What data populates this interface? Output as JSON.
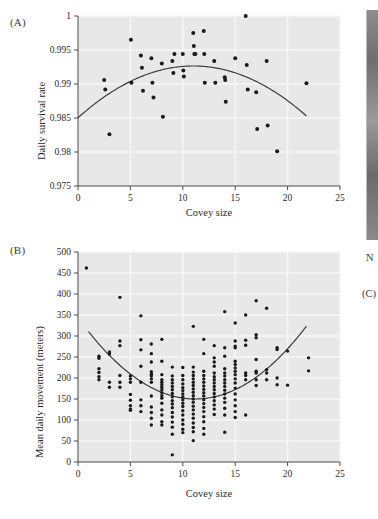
{
  "figure": {
    "panel_a_label": "(A)",
    "panel_b_label": "(B)",
    "edge_artifact_n": "N",
    "edge_artifact_c": "(C)",
    "page_background": "#ffffff",
    "plot_background": "#e8e8e8",
    "gridline_color": "#f7f7f7",
    "point_color": "#1a1a1a",
    "curve_color": "#3d3d3d",
    "axis_color": "#4a4a4a"
  },
  "chart_data": [
    {
      "type": "scatter",
      "id": "panel-a",
      "title": "(A)",
      "xlabel": "Covey size",
      "ylabel": "Daily survival rate",
      "xlim": [
        0,
        25
      ],
      "ylim": [
        0.975,
        1
      ],
      "xticks": [
        0,
        5,
        10,
        15,
        20,
        25
      ],
      "yticks": [
        0.975,
        0.98,
        0.985,
        0.99,
        0.995,
        1
      ],
      "xtick_labels": [
        "0",
        "5",
        "10",
        "15",
        "20",
        "25"
      ],
      "ytick_labels": [
        "0.975",
        "0.98",
        "0.985",
        "0.99",
        "0.995",
        "1"
      ],
      "grid": true,
      "legend": "none",
      "points": [
        [
          2.5,
          0.9906
        ],
        [
          2.6,
          0.9892
        ],
        [
          3.0,
          0.9826
        ],
        [
          5.05,
          0.9965
        ],
        [
          5.1,
          0.9902
        ],
        [
          6.0,
          0.9942
        ],
        [
          6.1,
          0.9924
        ],
        [
          6.2,
          0.989
        ],
        [
          7.0,
          0.9938
        ],
        [
          7.1,
          0.9902
        ],
        [
          7.2,
          0.988
        ],
        [
          8.0,
          0.993
        ],
        [
          8.1,
          0.9852
        ],
        [
          9.0,
          0.9934
        ],
        [
          9.1,
          0.9916
        ],
        [
          9.2,
          0.9944
        ],
        [
          10.0,
          0.9944
        ],
        [
          10.05,
          0.992
        ],
        [
          10.1,
          0.9911
        ],
        [
          11.0,
          0.9975
        ],
        [
          11.05,
          0.9956
        ],
        [
          11.1,
          0.9944
        ],
        [
          11.2,
          0.9944
        ],
        [
          12.0,
          0.9978
        ],
        [
          12.05,
          0.9944
        ],
        [
          12.1,
          0.9902
        ],
        [
          13.0,
          0.9934
        ],
        [
          13.1,
          0.9902
        ],
        [
          14.0,
          0.991
        ],
        [
          14.05,
          0.9906
        ],
        [
          14.1,
          0.9874
        ],
        [
          15.0,
          0.9938
        ],
        [
          16.0,
          1.0
        ],
        [
          16.1,
          0.9928
        ],
        [
          16.2,
          0.9892
        ],
        [
          17.0,
          0.9888
        ],
        [
          17.1,
          0.9834
        ],
        [
          18.0,
          0.9934
        ],
        [
          18.1,
          0.9839
        ],
        [
          19.0,
          0.9801
        ],
        [
          21.8,
          0.9901
        ]
      ],
      "fit_curve": {
        "shape": "quadratic-concave",
        "x_start": 0.0,
        "x_end": 21.8,
        "vertex_x": 11.0,
        "vertex_y": 0.99265,
        "y_at_x_start": 0.98555,
        "y_at_x_end": 0.9848
      }
    },
    {
      "type": "scatter",
      "id": "panel-b",
      "title": "(B)",
      "xlabel": "Covey size",
      "ylabel": "Mean daily movement (meters)",
      "xlim": [
        0,
        25
      ],
      "ylim": [
        0,
        500
      ],
      "xticks": [
        0,
        5,
        10,
        15,
        20,
        25
      ],
      "yticks": [
        0,
        50,
        100,
        150,
        200,
        250,
        300,
        350,
        400,
        450,
        500
      ],
      "xtick_labels": [
        "0",
        "5",
        "10",
        "15",
        "20",
        "25"
      ],
      "ytick_labels": [
        "0",
        "50",
        "100",
        "150",
        "200",
        "250",
        "300",
        "350",
        "400",
        "450",
        "500"
      ],
      "grid": true,
      "legend": "none",
      "points": [
        [
          0.8,
          462
        ],
        [
          2.0,
          252
        ],
        [
          2.0,
          247
        ],
        [
          2.0,
          222
        ],
        [
          2.0,
          213
        ],
        [
          2.0,
          203
        ],
        [
          2.0,
          196
        ],
        [
          3.0,
          262
        ],
        [
          3.0,
          257
        ],
        [
          3.0,
          190
        ],
        [
          3.0,
          178
        ],
        [
          4.0,
          392
        ],
        [
          4.0,
          288
        ],
        [
          4.0,
          277
        ],
        [
          4.0,
          206
        ],
        [
          4.0,
          190
        ],
        [
          4.0,
          178
        ],
        [
          5.0,
          205
        ],
        [
          5.0,
          198
        ],
        [
          5.0,
          190
        ],
        [
          5.0,
          161
        ],
        [
          5.0,
          147
        ],
        [
          5.0,
          134
        ],
        [
          5.0,
          126
        ],
        [
          5.0,
          123
        ],
        [
          6.0,
          348
        ],
        [
          6.0,
          291
        ],
        [
          6.0,
          267
        ],
        [
          6.0,
          228
        ],
        [
          6.0,
          190
        ],
        [
          6.0,
          148
        ],
        [
          6.0,
          134
        ],
        [
          6.0,
          120
        ],
        [
          7.0,
          281
        ],
        [
          7.0,
          258
        ],
        [
          7.0,
          238
        ],
        [
          7.0,
          215
        ],
        [
          7.0,
          209
        ],
        [
          7.0,
          205
        ],
        [
          7.0,
          198
        ],
        [
          7.0,
          190
        ],
        [
          7.0,
          157
        ],
        [
          7.0,
          131
        ],
        [
          7.0,
          118
        ],
        [
          7.0,
          104
        ],
        [
          7.0,
          88
        ],
        [
          8.0,
          292
        ],
        [
          8.0,
          240
        ],
        [
          8.0,
          208
        ],
        [
          8.0,
          196
        ],
        [
          8.0,
          190
        ],
        [
          8.0,
          184
        ],
        [
          8.0,
          178
        ],
        [
          8.0,
          172
        ],
        [
          8.0,
          165
        ],
        [
          8.0,
          158
        ],
        [
          8.0,
          152
        ],
        [
          8.0,
          140
        ],
        [
          8.0,
          124
        ],
        [
          8.0,
          112
        ],
        [
          8.0,
          96
        ],
        [
          8.0,
          88
        ],
        [
          9.0,
          226
        ],
        [
          9.0,
          205
        ],
        [
          9.0,
          196
        ],
        [
          9.0,
          188
        ],
        [
          9.0,
          180
        ],
        [
          9.0,
          172
        ],
        [
          9.0,
          163
        ],
        [
          9.0,
          155
        ],
        [
          9.0,
          146
        ],
        [
          9.0,
          138
        ],
        [
          9.0,
          129
        ],
        [
          9.0,
          118
        ],
        [
          9.0,
          107
        ],
        [
          9.0,
          95
        ],
        [
          9.0,
          83
        ],
        [
          9.0,
          66
        ],
        [
          9.0,
          17
        ],
        [
          10.0,
          225
        ],
        [
          10.0,
          206
        ],
        [
          10.0,
          196
        ],
        [
          10.0,
          186
        ],
        [
          10.0,
          177
        ],
        [
          10.0,
          170
        ],
        [
          10.0,
          162
        ],
        [
          10.0,
          155
        ],
        [
          10.0,
          148
        ],
        [
          10.0,
          140
        ],
        [
          10.0,
          132
        ],
        [
          10.0,
          122
        ],
        [
          10.0,
          112
        ],
        [
          10.0,
          100
        ],
        [
          10.0,
          90
        ],
        [
          10.0,
          78
        ],
        [
          10.0,
          70
        ],
        [
          11.0,
          323
        ],
        [
          11.0,
          226
        ],
        [
          11.0,
          214
        ],
        [
          11.0,
          206
        ],
        [
          11.0,
          198
        ],
        [
          11.0,
          190
        ],
        [
          11.0,
          182
        ],
        [
          11.0,
          174
        ],
        [
          11.0,
          166
        ],
        [
          11.0,
          158
        ],
        [
          11.0,
          150
        ],
        [
          11.0,
          142
        ],
        [
          11.0,
          133
        ],
        [
          11.0,
          124
        ],
        [
          11.0,
          114
        ],
        [
          11.0,
          104
        ],
        [
          11.0,
          93
        ],
        [
          11.0,
          82
        ],
        [
          11.0,
          72
        ],
        [
          11.0,
          51
        ],
        [
          12.0,
          292
        ],
        [
          12.0,
          258
        ],
        [
          12.0,
          216
        ],
        [
          12.0,
          206
        ],
        [
          12.0,
          198
        ],
        [
          12.0,
          190
        ],
        [
          12.0,
          181
        ],
        [
          12.0,
          173
        ],
        [
          12.0,
          165
        ],
        [
          12.0,
          157
        ],
        [
          12.0,
          148
        ],
        [
          12.0,
          139
        ],
        [
          12.0,
          130
        ],
        [
          12.0,
          120
        ],
        [
          12.0,
          108
        ],
        [
          12.0,
          96
        ],
        [
          12.0,
          80
        ],
        [
          12.0,
          66
        ],
        [
          13.0,
          277
        ],
        [
          13.0,
          248
        ],
        [
          13.0,
          238
        ],
        [
          13.0,
          228
        ],
        [
          13.0,
          212
        ],
        [
          13.0,
          203
        ],
        [
          13.0,
          196
        ],
        [
          13.0,
          188
        ],
        [
          13.0,
          180
        ],
        [
          13.0,
          172
        ],
        [
          13.0,
          163
        ],
        [
          13.0,
          155
        ],
        [
          13.0,
          146
        ],
        [
          13.0,
          136
        ],
        [
          13.0,
          126
        ],
        [
          13.0,
          113
        ],
        [
          14.0,
          358
        ],
        [
          14.0,
          272
        ],
        [
          14.0,
          252
        ],
        [
          14.0,
          222
        ],
        [
          14.0,
          212
        ],
        [
          14.0,
          205
        ],
        [
          14.0,
          196
        ],
        [
          14.0,
          188
        ],
        [
          14.0,
          180
        ],
        [
          14.0,
          171
        ],
        [
          14.0,
          162
        ],
        [
          14.0,
          152
        ],
        [
          14.0,
          142
        ],
        [
          14.0,
          128
        ],
        [
          14.0,
          112
        ],
        [
          14.0,
          71
        ],
        [
          15.0,
          331
        ],
        [
          15.0,
          288
        ],
        [
          15.0,
          276
        ],
        [
          15.0,
          272
        ],
        [
          15.0,
          240
        ],
        [
          15.0,
          232
        ],
        [
          15.0,
          224
        ],
        [
          15.0,
          216
        ],
        [
          15.0,
          208
        ],
        [
          15.0,
          198
        ],
        [
          15.0,
          188
        ],
        [
          15.0,
          176
        ],
        [
          15.0,
          162
        ],
        [
          15.0,
          148
        ],
        [
          15.0,
          134
        ],
        [
          15.0,
          120
        ],
        [
          15.0,
          106
        ],
        [
          16.0,
          350
        ],
        [
          16.0,
          290
        ],
        [
          16.0,
          278
        ],
        [
          16.0,
          212
        ],
        [
          16.0,
          206
        ],
        [
          16.0,
          196
        ],
        [
          16.0,
          112
        ],
        [
          17.0,
          384
        ],
        [
          17.0,
          303
        ],
        [
          17.0,
          296
        ],
        [
          17.0,
          244
        ],
        [
          17.0,
          216
        ],
        [
          17.0,
          212
        ],
        [
          17.0,
          196
        ],
        [
          17.0,
          182
        ],
        [
          18.0,
          366
        ],
        [
          18.0,
          220
        ],
        [
          18.0,
          212
        ],
        [
          18.0,
          196
        ],
        [
          19.0,
          272
        ],
        [
          19.0,
          268
        ],
        [
          19.0,
          200
        ],
        [
          19.0,
          184
        ],
        [
          20.0,
          264
        ],
        [
          20.0,
          183
        ],
        [
          22.0,
          248
        ],
        [
          22.0,
          217
        ]
      ],
      "fit_curve": {
        "shape": "quadratic-convex",
        "x_start": 1.0,
        "x_end": 21.8,
        "vertex_x": 11.2,
        "vertex_y": 150,
        "y_at_x_start": 287,
        "y_at_x_end": 349
      }
    }
  ]
}
